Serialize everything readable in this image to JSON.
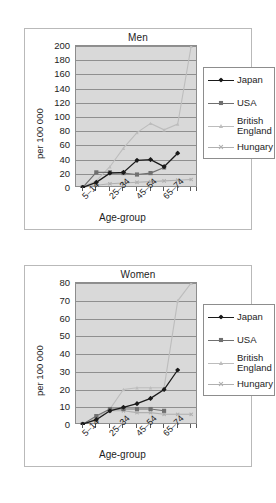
{
  "document": {
    "figure_count": 2,
    "background": "#ffffff",
    "frame_color": "#b9b9b9"
  },
  "style": {
    "plot_background": "#d9d9d9",
    "gridline_color": "#8f8f8f",
    "axis_color": "#5a5a5a",
    "text_color": "#1d1d1d",
    "series_colors": {
      "japan": "#1a1a1a",
      "usa": "#707070",
      "british_england": "#bdbdbd",
      "hungary": "#b0b0b0"
    }
  },
  "legend": {
    "entries": [
      {
        "label": "Japan",
        "marker": "diamond",
        "color": "#1a1a1a"
      },
      {
        "label": "USA",
        "marker": "square",
        "color": "#707070"
      },
      {
        "label": "British",
        "label2": "England",
        "marker": "triangle",
        "color": "#bdbdbd"
      },
      {
        "label": "Hungary",
        "marker": "cross",
        "color": "#b0b0b0"
      }
    ]
  },
  "chart_data": [
    {
      "type": "line",
      "title": "Men",
      "xlabel": "Age-group",
      "ylabel": "per 100 000",
      "ylim": [
        0,
        200
      ],
      "yticks": [
        0,
        20,
        40,
        60,
        80,
        100,
        120,
        140,
        160,
        180,
        200
      ],
      "grid": true,
      "legend_position": "right",
      "categories": [
        "5–14",
        "15–24",
        "25–34",
        "35–44",
        "45–54",
        "55–64",
        "65–74",
        "75–84",
        "85+"
      ],
      "tick_labels_shown": [
        "5–14",
        "",
        "25–34",
        "",
        "45–54",
        "",
        "65–74",
        "",
        ""
      ],
      "series": [
        {
          "name": "Japan",
          "values": [
            1,
            8,
            21,
            22,
            39,
            40,
            30,
            49,
            null
          ]
        },
        {
          "name": "USA",
          "values": [
            1,
            22,
            22,
            21,
            19,
            21,
            29,
            null,
            null
          ]
        },
        {
          "name": "British England",
          "values": [
            2,
            10,
            30,
            56,
            78,
            91,
            82,
            90,
            200
          ]
        },
        {
          "name": "Hungary",
          "values": [
            1,
            4,
            6,
            7,
            8,
            9,
            10,
            11,
            12
          ]
        }
      ]
    },
    {
      "type": "line",
      "title": "Women",
      "xlabel": "Age-group",
      "ylabel": "per 100 000",
      "ylim": [
        0,
        80
      ],
      "yticks": [
        0,
        10,
        20,
        30,
        40,
        50,
        60,
        70,
        80
      ],
      "grid": true,
      "legend_position": "right",
      "categories": [
        "5–14",
        "15–24",
        "25–34",
        "35–44",
        "45–54",
        "55–64",
        "65–74",
        "75–84",
        "85+"
      ],
      "tick_labels_shown": [
        "5–14",
        "",
        "25–34",
        "",
        "45–54",
        "",
        "65–74",
        "",
        ""
      ],
      "series": [
        {
          "name": "Japan",
          "values": [
            0.5,
            3,
            8,
            10,
            12,
            15,
            20,
            31,
            null
          ]
        },
        {
          "name": "USA",
          "values": [
            0.5,
            5,
            9,
            9,
            9,
            9,
            8,
            null,
            null
          ]
        },
        {
          "name": "British England",
          "values": [
            0.5,
            4,
            9,
            20,
            21,
            21,
            21,
            70,
            80
          ]
        },
        {
          "name": "Hungary",
          "values": [
            0.5,
            3,
            8,
            8,
            7,
            7,
            6,
            6,
            6
          ]
        }
      ]
    }
  ]
}
